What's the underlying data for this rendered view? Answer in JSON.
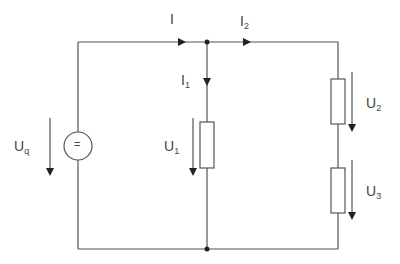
{
  "diagram": {
    "type": "circuit",
    "labels": {
      "I": "I",
      "I1_main": "I",
      "I1_sub": "1",
      "I2_main": "I",
      "I2_sub": "2",
      "Uq_main": "U",
      "Uq_sub": "q",
      "U1_main": "U",
      "U1_sub": "1",
      "U2_main": "U",
      "U2_sub": "2",
      "U3_main": "U",
      "U3_sub": "3",
      "source_symbol": "="
    },
    "components": [
      "voltage source Uq (DC)",
      "resistor R1 (voltage U1)",
      "resistor R2 (voltage U2)",
      "resistor R3 (voltage U3)"
    ],
    "line_color": "#555555"
  }
}
